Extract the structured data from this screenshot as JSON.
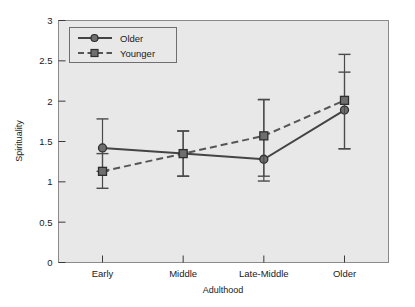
{
  "chart_data": {
    "type": "line",
    "title": "",
    "xlabel": "Adulthood",
    "ylabel": "Spirituality",
    "categories": [
      "Early",
      "Middle",
      "Late-Middle",
      "Older"
    ],
    "ylim": [
      0,
      3
    ],
    "yticks": [
      "0",
      "0.5",
      "1",
      "1.5",
      "2",
      "2.5",
      "3"
    ],
    "ytick_values": [
      0,
      0.5,
      1,
      1.5,
      2,
      2.5,
      3
    ],
    "grid": false,
    "legend_position": "top-left",
    "errorbars": true,
    "series": [
      {
        "name": "Older",
        "line_style": "solid",
        "marker": "circle",
        "color": "#444444",
        "values": [
          1.42,
          1.35,
          1.28,
          1.89
        ],
        "err_low": [
          1.13,
          1.07,
          1.01,
          1.41
        ],
        "err_high": [
          1.78,
          1.63,
          2.02,
          2.58
        ]
      },
      {
        "name": "Younger",
        "line_style": "dashed",
        "marker": "square",
        "color": "#555555",
        "values": [
          1.13,
          1.35,
          1.57,
          2.01
        ],
        "err_low": [
          0.92,
          1.07,
          1.07,
          1.41
        ],
        "err_high": [
          1.35,
          1.63,
          2.02,
          2.36
        ]
      }
    ]
  },
  "plot": {
    "background_color": "#e8e8e8",
    "border_color": "#8a8a8a",
    "axis_text_color": "#1a1a1a"
  },
  "legend": {
    "items": [
      {
        "label": "Older"
      },
      {
        "label": "Younger"
      }
    ]
  }
}
